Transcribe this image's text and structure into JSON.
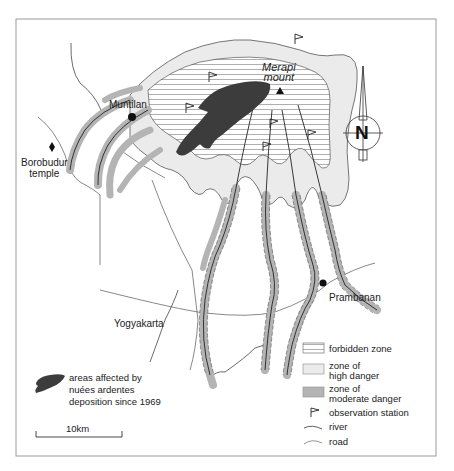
{
  "map": {
    "frame": {
      "x": 16,
      "y": 19,
      "w": 420,
      "h": 437
    },
    "volcano": {
      "name_line1": "Merapi",
      "name_line2": "mount"
    },
    "places": {
      "muntilan": "Muntilan",
      "borobudur_line1": "Borobudur",
      "borobudur_line2": "temple",
      "prambanan": "Prambanan",
      "yogyakarta": "Yogyakarta"
    },
    "north_arrow": {
      "letter": "N"
    },
    "scale_bar": {
      "label": "10km"
    },
    "nuees_legend": {
      "line1": "areas affected by",
      "line2": "nuées ardentes",
      "line3": "deposition since 1969"
    },
    "legend": {
      "forbidden_zone": "forbidden zone",
      "high_danger_line1": "zone of",
      "high_danger_line2": "high danger",
      "moderate_danger_line1": "zone of",
      "moderate_danger_line2": "moderate danger",
      "observation_station": "observation station",
      "river": "river",
      "road": "road"
    },
    "colors": {
      "frame": "#9a9a9a",
      "high_danger_fill": "#ebebeb",
      "moderate_danger_fill": "#b4b4b4",
      "nuees_fill": "#3c3c3c",
      "line": "#333333",
      "hatch": "#9a9a9a"
    }
  }
}
